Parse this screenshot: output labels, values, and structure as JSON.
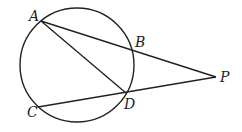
{
  "diagram": {
    "circle": {
      "cx": 77,
      "cy": 65,
      "r": 57
    },
    "points": [
      {
        "id": "A",
        "label": "A",
        "x": 41,
        "y": 21,
        "lx": 29,
        "ly": 21
      },
      {
        "id": "B",
        "label": "B",
        "x": 132,
        "y": 49,
        "lx": 135,
        "ly": 47
      },
      {
        "id": "D",
        "label": "D",
        "x": 126,
        "y": 93,
        "lx": 124,
        "ly": 109
      },
      {
        "id": "C",
        "label": "C",
        "x": 38,
        "y": 107,
        "lx": 27,
        "ly": 117
      },
      {
        "id": "P",
        "label": "P",
        "x": 216,
        "y": 77,
        "lx": 220,
        "ly": 82
      }
    ],
    "segments": [
      {
        "from": "A",
        "to": "P"
      },
      {
        "from": "A",
        "to": "D"
      },
      {
        "from": "C",
        "to": "P"
      }
    ],
    "stroke_color": "#222222"
  }
}
